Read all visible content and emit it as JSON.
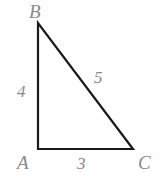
{
  "figure": {
    "background_color": "#ffffff",
    "stroke_color": "#1a1a1a",
    "label_color": "#8a8a8a",
    "width": 165,
    "height": 176
  },
  "vertices": {
    "B": {
      "label": "B",
      "x": 38,
      "y": 23
    },
    "A": {
      "label": "A",
      "x": 38,
      "y": 149
    },
    "C": {
      "label": "C",
      "x": 133,
      "y": 149
    }
  },
  "sides": {
    "AB": {
      "label": "4",
      "from": "A",
      "to": "B"
    },
    "BC": {
      "label": "5",
      "from": "B",
      "to": "C"
    },
    "AC": {
      "label": "3",
      "from": "A",
      "to": "C"
    }
  },
  "chart_data": {
    "type": "diagram",
    "shape": "right-triangle",
    "title": "",
    "points": [
      {
        "name": "B",
        "x": 38,
        "y": 23
      },
      {
        "name": "A",
        "x": 38,
        "y": 149
      },
      {
        "name": "C",
        "x": 133,
        "y": 149
      }
    ],
    "edges": [
      {
        "from": "A",
        "to": "B",
        "length_label": "4"
      },
      {
        "from": "B",
        "to": "C",
        "length_label": "5"
      },
      {
        "from": "A",
        "to": "C",
        "length_label": "3"
      }
    ],
    "right_angle_at": "A"
  }
}
